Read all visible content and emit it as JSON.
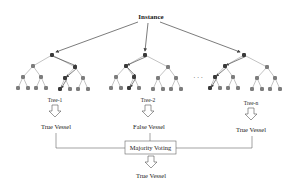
{
  "diagram": {
    "title": "Instance",
    "ellipsis": "· · ·",
    "trees": [
      {
        "label": "Tree-1",
        "output": "True Vessel",
        "root": [
          52,
          55
        ],
        "path": "right-left"
      },
      {
        "label": "Tree-2",
        "output": "False Vessel",
        "root": [
          145,
          55
        ],
        "path": "left-right"
      },
      {
        "label": "Tree-n",
        "output": "True Vessel",
        "root": [
          244,
          55
        ],
        "path": "left-left"
      }
    ],
    "aggregator": {
      "label": "Majority Voting"
    },
    "final_output": "True Vessel",
    "colors": {
      "line": "#555555",
      "edge": "#9a9a9a",
      "node": "#7d7d7d",
      "node_active": "#3a3a3a",
      "text": "#222222"
    }
  }
}
